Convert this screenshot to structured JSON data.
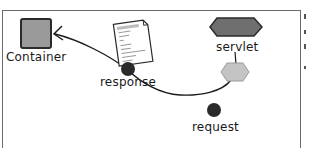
{
  "diagram": {
    "nodes": {
      "container": {
        "label": "Container",
        "shape": "square",
        "fill": "#9a9a9a"
      },
      "servlet": {
        "label": "servlet",
        "shape": "hexagon",
        "fill": "#6f6f6f"
      },
      "servlet_thread": {
        "label": "",
        "shape": "hexagon",
        "fill": "#c4c4c4"
      },
      "response": {
        "label": "response",
        "shape": "dot",
        "fill": "#2a2a2a"
      },
      "request": {
        "label": "request",
        "shape": "dot",
        "fill": "#2a2a2a"
      },
      "document": {
        "label": "",
        "shape": "document-icon"
      }
    },
    "edges": [
      {
        "from": "servlet",
        "to": "servlet_thread",
        "style": "line"
      },
      {
        "from": "servlet_thread",
        "to": "container",
        "via": "response",
        "style": "curved-arrow"
      }
    ],
    "colors": {
      "frame": "#6b6b6b",
      "stroke": "#1a1a1a",
      "text": "#1a1a1a"
    }
  }
}
